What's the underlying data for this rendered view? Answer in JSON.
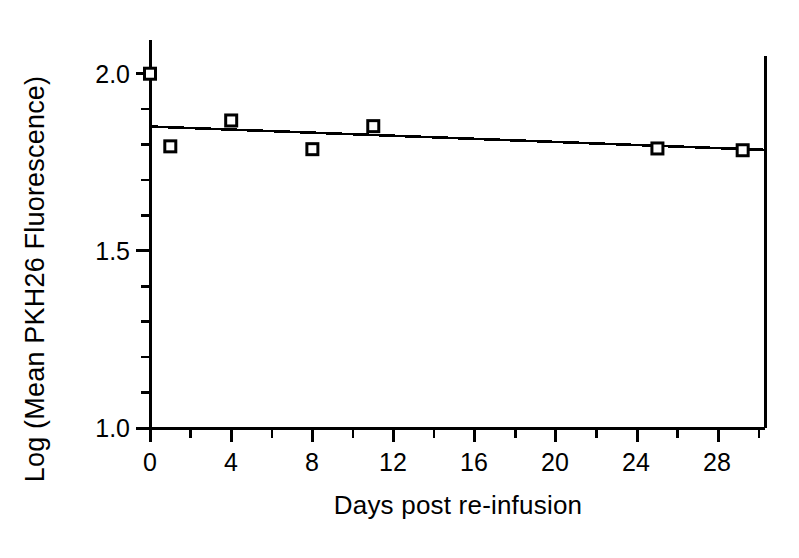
{
  "chart_data": {
    "type": "scatter",
    "title": "",
    "xlabel": "Days post re-infusion",
    "ylabel": "Log (Mean PKH26 Fluorescence)",
    "xlim": [
      0,
      30.3
    ],
    "ylim": [
      1.0,
      2.05
    ],
    "grid": false,
    "legend": null,
    "x_ticks_major": [
      0,
      4,
      8,
      12,
      16,
      20,
      24,
      28
    ],
    "x_tick_labels": [
      "0",
      "4",
      "8",
      "12",
      "16",
      "20",
      "24",
      "28"
    ],
    "x_ticks_minor": [
      2,
      6,
      10,
      14,
      18,
      22,
      26,
      30
    ],
    "y_ticks_major": [
      1.0,
      1.5,
      2.0
    ],
    "y_tick_labels": [
      "1.0",
      "1.5",
      "2.0"
    ],
    "y_ticks_minor": [
      1.1,
      1.2,
      1.3,
      1.4,
      1.6,
      1.7,
      1.8,
      1.9
    ],
    "marker": "open-square",
    "series": [
      {
        "name": "Mean PKH26 fluorescence",
        "points": [
          {
            "x": 0,
            "y": 2.0
          },
          {
            "x": 1,
            "y": 1.795
          },
          {
            "x": 4,
            "y": 1.868
          },
          {
            "x": 8,
            "y": 1.787
          },
          {
            "x": 11,
            "y": 1.852
          },
          {
            "x": 25,
            "y": 1.789
          },
          {
            "x": 29.2,
            "y": 1.784
          }
        ]
      }
    ],
    "trendline": {
      "name": "linear regression fit",
      "x_start": 0,
      "y_start": 1.851,
      "x_end": 30.3,
      "y_end": 1.785
    }
  }
}
